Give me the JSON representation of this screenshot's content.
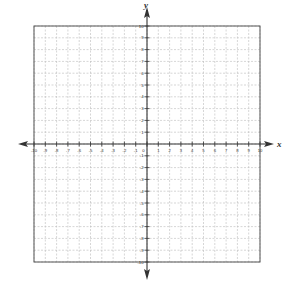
{
  "chart_data": {
    "type": "coordinate-grid",
    "title": "",
    "xlabel": "x",
    "ylabel": "y",
    "xlim": [
      -10,
      10
    ],
    "ylim": [
      -10,
      10
    ],
    "grid": true,
    "grid_style": "dashed",
    "x_tick_labels": [
      "-10",
      "-9",
      "-8",
      "-7",
      "-6",
      "-5",
      "-4",
      "-3",
      "-2",
      "-1",
      "0",
      "1",
      "2",
      "3",
      "4",
      "5",
      "6",
      "7",
      "8",
      "9",
      "10"
    ],
    "y_tick_labels": [
      "10",
      "9",
      "8",
      "7",
      "6",
      "5",
      "4",
      "3",
      "2",
      "1",
      "0",
      "-1",
      "-2",
      "-3",
      "-4",
      "-5",
      "-6",
      "-7",
      "-8",
      "-9",
      "-10"
    ],
    "series": [],
    "legend": null
  },
  "colors": {
    "axis": "#333333",
    "grid": "#bbbbbb",
    "border": "#555555",
    "background": "#ffffff"
  },
  "layout": {
    "left": 34,
    "right": 260,
    "top": 26,
    "bottom": 262
  }
}
